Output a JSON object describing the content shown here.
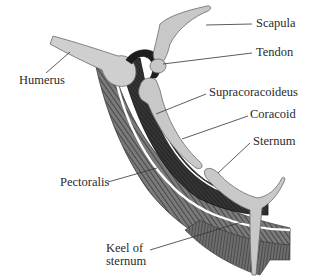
{
  "figure": {
    "labels": {
      "scapula": "Scapula",
      "tendon": "Tendon",
      "humerus": "Humerus",
      "supracoracoideus": "Supracoracoideus",
      "coracoid": "Coracoid",
      "sternum": "Sternum",
      "pectoralis": "Pectoralis",
      "keel_line1": "Keel of",
      "keel_line2": "sternum"
    },
    "colors": {
      "bone": "#c8c8c8",
      "bone_outline": "#6a6a6a",
      "muscle_dark": "#2b2b2b",
      "muscle_mid": "#6b6b6b",
      "leader_line": "#333333",
      "background": "#ffffff"
    }
  }
}
